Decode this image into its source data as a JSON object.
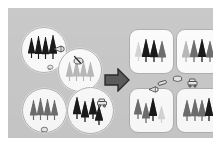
{
  "figure": {
    "background_color": "#c9c9c9",
    "margin_color": "#ffffff",
    "panel": {
      "x": 8,
      "y": 8,
      "width": 205,
      "height": 130
    }
  },
  "palette": {
    "tree_dark": "#1a1a1a",
    "tree_mid": "#6e6e6e",
    "tree_light": "#b9b9b9",
    "tree_pale": "#d6d6d6",
    "circle_fill": "#fbfbfb",
    "circle_stroke": "#b4b4b4",
    "box_fill": "#fcfcfc",
    "box_stroke": "#b0b0b0",
    "arrow_fill": "#5c5c5c",
    "arrow_stroke": "#2b2b2b"
  },
  "arrow": {
    "label": "transformation-arrow",
    "direction": "right",
    "x": 96,
    "y": 60,
    "width": 26,
    "height": 24,
    "fill": "#5c5c5c"
  },
  "sample_plots": [
    {
      "id": "plot-top-left",
      "label": "Sample plot 1",
      "x": 13,
      "y": 19,
      "size": 44,
      "trees": [
        {
          "x": 6,
          "y": 10,
          "h": 20,
          "w": 7,
          "shade": "tree_dark"
        },
        {
          "x": 13,
          "y": 8,
          "h": 23,
          "w": 7,
          "shade": "tree_dark"
        },
        {
          "x": 20,
          "y": 9,
          "h": 22,
          "w": 7,
          "shade": "tree_dark"
        },
        {
          "x": 27,
          "y": 7,
          "h": 24,
          "w": 8,
          "shade": "tree_dark"
        }
      ],
      "marks": [
        {
          "type": "caliper-icon",
          "x": 31,
          "y": 12,
          "w": 12,
          "h": 10
        },
        {
          "type": "tape-icon",
          "x": 24,
          "y": 29,
          "w": 8,
          "h": 7
        }
      ]
    },
    {
      "id": "plot-top-right",
      "label": "Sample plot 2",
      "x": 50,
      "y": 40,
      "size": 42,
      "trees": [
        {
          "x": 7,
          "y": 13,
          "h": 19,
          "w": 7,
          "shade": "tree_light"
        },
        {
          "x": 14,
          "y": 11,
          "h": 21,
          "w": 7,
          "shade": "tree_light"
        },
        {
          "x": 21,
          "y": 12,
          "h": 20,
          "w": 7,
          "shade": "tree_light"
        },
        {
          "x": 28,
          "y": 13,
          "h": 19,
          "w": 7,
          "shade": "tree_light"
        }
      ],
      "marks": [
        {
          "type": "increment-borer-icon",
          "x": 13,
          "y": 2,
          "w": 12,
          "h": 10
        }
      ]
    },
    {
      "id": "plot-bottom-left",
      "label": "Sample plot 3",
      "x": 14,
      "y": 80,
      "size": 43,
      "trees": [
        {
          "x": 7,
          "y": 11,
          "h": 20,
          "w": 7,
          "shade": "tree_mid"
        },
        {
          "x": 14,
          "y": 9,
          "h": 22,
          "w": 7,
          "shade": "tree_mid"
        },
        {
          "x": 21,
          "y": 10,
          "h": 21,
          "w": 7,
          "shade": "tree_mid"
        },
        {
          "x": 28,
          "y": 11,
          "h": 20,
          "w": 7,
          "shade": "tree_mid"
        }
      ],
      "marks": [
        {
          "type": "tape-icon",
          "x": 16,
          "y": 31,
          "w": 10,
          "h": 8
        }
      ]
    },
    {
      "id": "plot-bottom-right",
      "label": "Sample plot 4",
      "x": 59,
      "y": 79,
      "size": 45,
      "trees": [
        {
          "x": 5,
          "y": 9,
          "h": 22,
          "w": 8,
          "shade": "tree_dark"
        },
        {
          "x": 13,
          "y": 13,
          "h": 21,
          "w": 8,
          "shade": "tree_dark"
        },
        {
          "x": 21,
          "y": 10,
          "h": 21,
          "w": 8,
          "shade": "tree_dark"
        },
        {
          "x": 27,
          "y": 18,
          "h": 19,
          "w": 8,
          "shade": "tree_dark"
        }
      ],
      "marks": [
        {
          "type": "harvester-icon",
          "x": 28,
          "y": 6,
          "w": 12,
          "h": 10
        }
      ]
    }
  ],
  "stands": [
    {
      "id": "stand-top-left",
      "label": "Stand A",
      "x": 121,
      "y": 21,
      "width": 43,
      "height": 43,
      "trees": [
        {
          "x": 5,
          "y": 12,
          "h": 19,
          "w": 7,
          "shade": "tree_pale"
        },
        {
          "x": 12,
          "y": 9,
          "h": 23,
          "w": 8,
          "shade": "tree_dark"
        },
        {
          "x": 20,
          "y": 10,
          "h": 22,
          "w": 8,
          "shade": "tree_dark"
        },
        {
          "x": 28,
          "y": 11,
          "h": 21,
          "w": 8,
          "shade": "tree_mid"
        }
      ]
    },
    {
      "id": "stand-top-right",
      "label": "Stand B",
      "x": 168,
      "y": 21,
      "width": 43,
      "height": 43,
      "trees": [
        {
          "x": 5,
          "y": 11,
          "h": 21,
          "w": 8,
          "shade": "tree_light"
        },
        {
          "x": 13,
          "y": 10,
          "h": 22,
          "w": 8,
          "shade": "tree_mid"
        },
        {
          "x": 21,
          "y": 9,
          "h": 23,
          "w": 8,
          "shade": "tree_dark"
        },
        {
          "x": 29,
          "y": 11,
          "h": 21,
          "w": 8,
          "shade": "tree_mid"
        }
      ]
    },
    {
      "id": "stand-bottom-left",
      "label": "Stand C",
      "x": 121,
      "y": 80,
      "width": 43,
      "height": 43,
      "trees": [
        {
          "x": 4,
          "y": 10,
          "h": 20,
          "w": 8,
          "shade": "tree_mid"
        },
        {
          "x": 12,
          "y": 14,
          "h": 20,
          "w": 8,
          "shade": "tree_mid"
        },
        {
          "x": 19,
          "y": 9,
          "h": 23,
          "w": 8,
          "shade": "tree_dark"
        },
        {
          "x": 28,
          "y": 17,
          "h": 17,
          "w": 7,
          "shade": "tree_pale"
        }
      ]
    },
    {
      "id": "stand-bottom-right",
      "label": "Stand D",
      "x": 168,
      "y": 80,
      "width": 43,
      "height": 43,
      "trees": [
        {
          "x": 6,
          "y": 11,
          "h": 21,
          "w": 8,
          "shade": "tree_mid"
        },
        {
          "x": 14,
          "y": 10,
          "h": 22,
          "w": 8,
          "shade": "tree_mid"
        },
        {
          "x": 21,
          "y": 11,
          "h": 21,
          "w": 8,
          "shade": "tree_mid"
        },
        {
          "x": 28,
          "y": 9,
          "h": 23,
          "w": 8,
          "shade": "tree_dark"
        }
      ]
    }
  ],
  "center_icons": [
    {
      "type": "log-icon",
      "label": "felled log",
      "x": 149,
      "y": 66,
      "w": 12,
      "h": 11
    },
    {
      "type": "stump-icon",
      "label": "stump",
      "x": 163,
      "y": 62,
      "w": 13,
      "h": 9
    },
    {
      "type": "harvester-icon",
      "label": "harvester",
      "x": 178,
      "y": 66,
      "w": 13,
      "h": 10
    },
    {
      "type": "caliper-icon",
      "label": "measuring tool",
      "x": 140,
      "y": 72,
      "w": 11,
      "h": 9
    }
  ]
}
